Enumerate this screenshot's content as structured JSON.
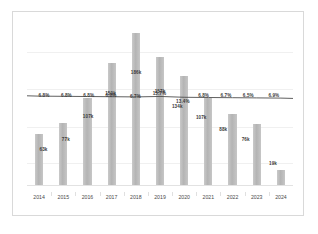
{
  "chart_data": {
    "type": "bar",
    "title": "",
    "subtitle": "",
    "xlabel": "",
    "ylabel": "",
    "grid": true,
    "legend_position": "none",
    "ylim": [
      0,
      200
    ],
    "categories": [
      "2014",
      "2015",
      "2016",
      "2017",
      "2018",
      "2019",
      "2020",
      "2021",
      "2022",
      "2023",
      "2024"
    ],
    "series": [
      {
        "name": "Volume (thousands)",
        "type": "bar",
        "values": [
          63,
          77,
          107,
          150,
          186,
          157,
          134,
          107,
          88,
          76,
          19
        ],
        "labels": [
          "63k",
          "77k",
          "107k",
          "150k",
          "186k",
          "157k",
          "134k",
          "107k",
          "88k",
          "76k",
          "19k"
        ]
      },
      {
        "name": "Rate (%)",
        "type": "line",
        "values": [
          6.8,
          6.8,
          6.8,
          6.8,
          6.7,
          6.6,
          6.5,
          6.8,
          6.7,
          6.5,
          6.9
        ],
        "labels": [
          "6.8%",
          "6.8%",
          "6.8%",
          "6.8%",
          "6.7%",
          "6.6%",
          "6.5%",
          "6.8%",
          "6.7%",
          "6.5%",
          "6.9%"
        ]
      }
    ],
    "bar_color": "#b4b4b4",
    "line_color": "#4d4d4d",
    "gridline_color": "#f0f0f0",
    "background_color": "#ffffff",
    "border_color": "#d9d9d9"
  },
  "value_labels": [
    {
      "text": "63k",
      "x": 6.2,
      "y": 76
    },
    {
      "text": "77k",
      "x": 14.6,
      "y": 70
    },
    {
      "text": "107k",
      "x": 23.0,
      "y": 56
    },
    {
      "text": "150k",
      "x": 31.4,
      "y": 42
    },
    {
      "text": "186k",
      "x": 41.0,
      "y": 29
    },
    {
      "text": "157k",
      "x": 50.0,
      "y": 41
    },
    {
      "text": "134k",
      "x": 56.5,
      "y": 50
    },
    {
      "text": "107k",
      "x": 65.5,
      "y": 57
    },
    {
      "text": "88k",
      "x": 73.8,
      "y": 64
    },
    {
      "text": "76k",
      "x": 82.2,
      "y": 70
    },
    {
      "text": "19k",
      "x": 92.5,
      "y": 85
    }
  ],
  "pct_labels": [
    {
      "text": "6.8%",
      "x": 6.4,
      "y": 43
    },
    {
      "text": "6.8%",
      "x": 14.8,
      "y": 43
    },
    {
      "text": "6.8%",
      "x": 23.2,
      "y": 43
    },
    {
      "text": "6.8%",
      "x": 31.6,
      "y": 43
    },
    {
      "text": "6.7%",
      "x": 40.8,
      "y": 44
    },
    {
      "text": "15.7%",
      "x": 49.8,
      "y": 42
    },
    {
      "text": "13.4%",
      "x": 58.6,
      "y": 47
    },
    {
      "text": "6.8%",
      "x": 66.4,
      "y": 43
    },
    {
      "text": "6.7%",
      "x": 74.8,
      "y": 43
    },
    {
      "text": "6.5%",
      "x": 83.2,
      "y": 43
    },
    {
      "text": "6.9%",
      "x": 92.8,
      "y": 43
    }
  ]
}
